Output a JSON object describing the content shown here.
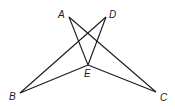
{
  "diagram": {
    "type": "geometry-figure",
    "points": {
      "A": {
        "label": "A",
        "x": 69,
        "y": 17,
        "lx": 58,
        "ly": 18
      },
      "D": {
        "label": "D",
        "x": 106,
        "y": 17,
        "lx": 109,
        "ly": 18
      },
      "E": {
        "label": "E",
        "x": 88,
        "y": 65,
        "lx": 84,
        "ly": 77
      },
      "B": {
        "label": "B",
        "x": 20,
        "y": 93,
        "lx": 9,
        "ly": 100
      },
      "C": {
        "label": "C",
        "x": 156,
        "y": 92,
        "lx": 160,
        "ly": 101
      }
    },
    "segments": [
      [
        "A",
        "E"
      ],
      [
        "A",
        "C"
      ],
      [
        "D",
        "E"
      ],
      [
        "D",
        "B"
      ],
      [
        "B",
        "E"
      ],
      [
        "E",
        "C"
      ]
    ]
  }
}
